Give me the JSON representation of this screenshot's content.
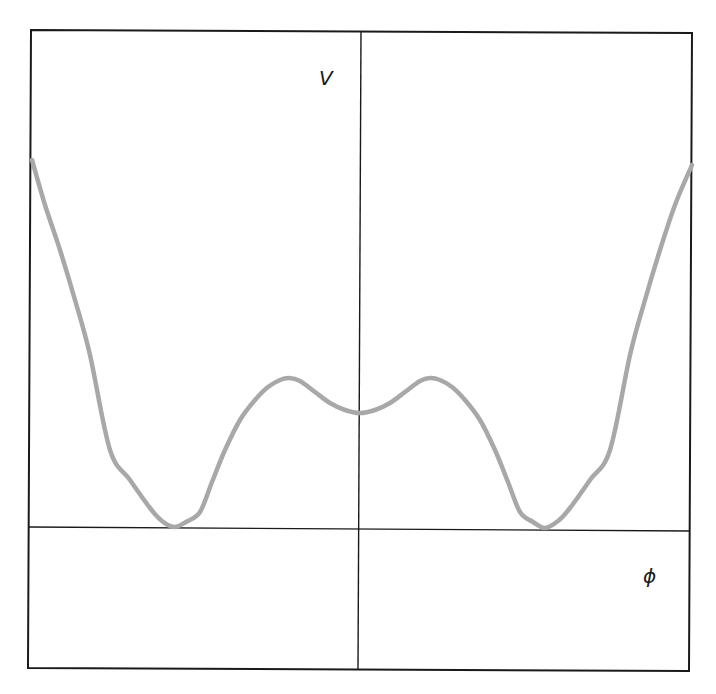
{
  "diagram": {
    "title": "",
    "y_axis_label": "V",
    "x_axis_label": "ϕ",
    "curve_color": "#a8a8a8",
    "axis_color": "#1a1a1a"
  },
  "chart_data": {
    "type": "line",
    "title": "",
    "xlabel": "ϕ",
    "ylabel": "V",
    "grid": false,
    "features": {
      "local_min_center": {
        "x": 0,
        "y": 0.38
      },
      "local_maxima": [
        {
          "x": -0.43,
          "y": 0.5
        },
        {
          "x": 0.43,
          "y": 0.5
        }
      ],
      "global_minima": [
        {
          "x": -1.0,
          "y": 0.0
        },
        {
          "x": 1.0,
          "y": 0.0
        }
      ]
    },
    "series": [
      {
        "name": "V(phi)",
        "points_px": [
          [
            32,
            160
          ],
          [
            45,
            205
          ],
          [
            60,
            250
          ],
          [
            75,
            300
          ],
          [
            90,
            355
          ],
          [
            110,
            450
          ],
          [
            130,
            480
          ],
          [
            150,
            508
          ],
          [
            162,
            521
          ],
          [
            174,
            527
          ],
          [
            186,
            522
          ],
          [
            200,
            512
          ],
          [
            212,
            482
          ],
          [
            225,
            450
          ],
          [
            240,
            420
          ],
          [
            255,
            400
          ],
          [
            268,
            387
          ],
          [
            280,
            380
          ],
          [
            289,
            378
          ],
          [
            300,
            381
          ],
          [
            315,
            392
          ],
          [
            330,
            403
          ],
          [
            345,
            410
          ],
          [
            360,
            413
          ],
          [
            375,
            410
          ],
          [
            390,
            403
          ],
          [
            405,
            392
          ],
          [
            420,
            381
          ],
          [
            430,
            378
          ],
          [
            440,
            380
          ],
          [
            452,
            387
          ],
          [
            465,
            400
          ],
          [
            480,
            420
          ],
          [
            495,
            450
          ],
          [
            508,
            482
          ],
          [
            520,
            512
          ],
          [
            533,
            522
          ],
          [
            545,
            528
          ],
          [
            558,
            521
          ],
          [
            570,
            508
          ],
          [
            590,
            480
          ],
          [
            610,
            450
          ],
          [
            630,
            355
          ],
          [
            645,
            300
          ],
          [
            660,
            250
          ],
          [
            675,
            205
          ],
          [
            692,
            165
          ]
        ]
      }
    ]
  },
  "layout": {
    "frame": {
      "x1": 30,
      "y1": 31,
      "x2": 691,
      "y2": 670
    },
    "x_axis_y": 529,
    "y_axis_x": 360,
    "y_label_pos": {
      "left": 319,
      "top": 68
    },
    "x_label_pos": {
      "left": 643,
      "top": 566
    }
  }
}
